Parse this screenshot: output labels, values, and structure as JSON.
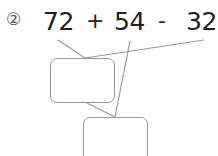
{
  "problem": {
    "number": "②",
    "terms": [
      "72",
      "54",
      "32"
    ],
    "operators": [
      "+",
      "-"
    ]
  },
  "diagram": {
    "line_color": "#9a9a9a",
    "boxes": [
      {
        "name": "first-result-box",
        "value": ""
      },
      {
        "name": "final-result-box",
        "value": ""
      }
    ]
  }
}
